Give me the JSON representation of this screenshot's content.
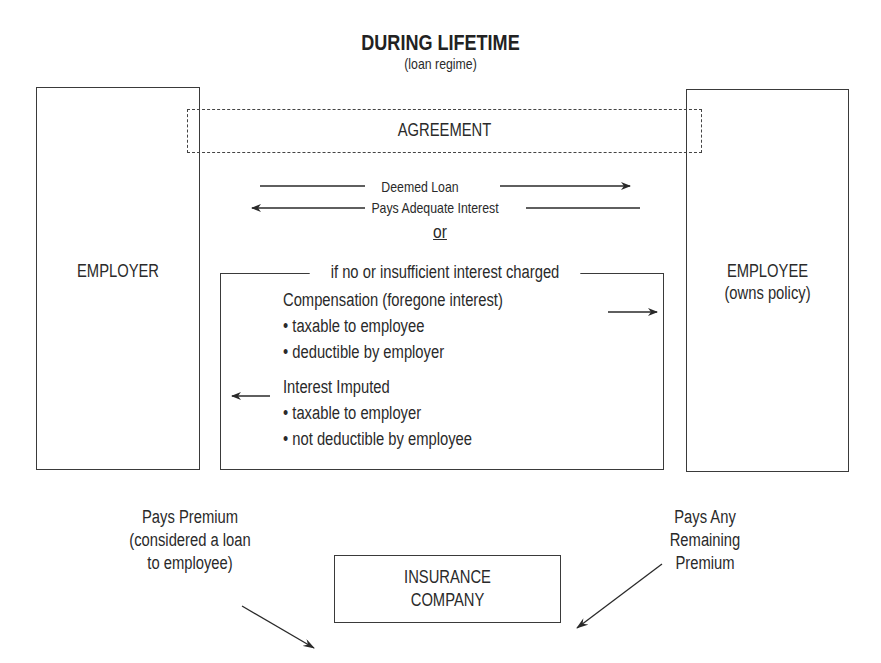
{
  "title": "DURING LIFETIME",
  "subtitle": "(loan regime)",
  "agreement": "AGREEMENT",
  "employer": "EMPLOYER",
  "employee": {
    "line1": "EMPLOYEE",
    "line2": "(owns policy)"
  },
  "flows": {
    "deemed_loan": "Deemed Loan",
    "pays_adequate_interest": "Pays Adequate Interest",
    "or": "or"
  },
  "insufficient": {
    "header": "if no or insufficient interest charged",
    "compensation": {
      "heading": "Compensation (foregone interest)",
      "bullets": [
        "taxable to employee",
        "deductible by employer"
      ]
    },
    "imputed": {
      "heading": "Interest Imputed",
      "bullets": [
        "taxable to employer",
        "not deductible by employee"
      ]
    }
  },
  "premium_left": {
    "line1": "Pays Premium",
    "line2": "(considered a loan",
    "line3": "to employee)"
  },
  "premium_right": {
    "line1": "Pays Any",
    "line2": "Remaining",
    "line3": "Premium"
  },
  "insurer": {
    "line1": "INSURANCE",
    "line2": "COMPANY"
  },
  "bullet_glyph": "•"
}
